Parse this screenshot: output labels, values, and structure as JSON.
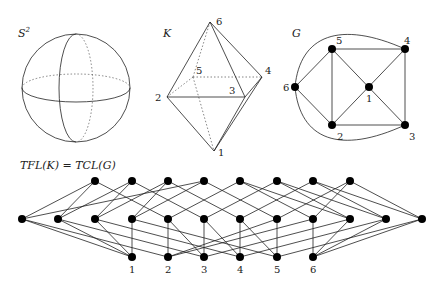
{
  "panels": {
    "sphere": {
      "title": "S",
      "superscript": "2"
    },
    "complex": {
      "title": "K",
      "vertices": [
        {
          "id": "1",
          "x": 214,
          "y": 151,
          "lx": 218,
          "ly": 156
        },
        {
          "id": "2",
          "x": 167,
          "y": 97,
          "lx": 155,
          "ly": 101
        },
        {
          "id": "3",
          "x": 245,
          "y": 97,
          "lx": 229,
          "ly": 94
        },
        {
          "id": "4",
          "x": 262,
          "y": 77,
          "lx": 265,
          "ly": 74
        },
        {
          "id": "5",
          "x": 193,
          "y": 77,
          "lx": 196,
          "ly": 74
        },
        {
          "id": "6",
          "x": 210,
          "y": 22,
          "lx": 216,
          "ly": 25
        }
      ]
    },
    "graph": {
      "title": "G",
      "vertices": [
        {
          "id": "1",
          "x": 369,
          "y": 87,
          "lx": 366,
          "ly": 102
        },
        {
          "id": "2",
          "x": 332,
          "y": 125,
          "lx": 337,
          "ly": 140
        },
        {
          "id": "3",
          "x": 405,
          "y": 125,
          "lx": 409,
          "ly": 140
        },
        {
          "id": "4",
          "x": 405,
          "y": 49,
          "lx": 404,
          "ly": 44
        },
        {
          "id": "5",
          "x": 332,
          "y": 49,
          "lx": 336,
          "ly": 44
        },
        {
          "id": "6",
          "x": 295,
          "y": 87,
          "lx": 283,
          "ly": 91
        }
      ]
    }
  },
  "lattice": {
    "title": "TFL(K) = TCL(G)",
    "top_y": 181,
    "mid_y": 219,
    "bot_y": 257,
    "top_x": [
      95,
      132,
      168,
      204,
      240,
      277,
      313,
      350
    ],
    "mid_x": [
      22,
      58,
      95,
      132,
      168,
      204,
      240,
      277,
      313,
      350,
      386,
      422
    ],
    "bot_x": [
      132,
      168,
      204,
      240,
      277,
      313
    ],
    "bottom_labels": [
      "1",
      "2",
      "3",
      "4",
      "5",
      "6"
    ],
    "top_mid_edges": [
      [
        0,
        0
      ],
      [
        0,
        1
      ],
      [
        0,
        4
      ],
      [
        1,
        1
      ],
      [
        1,
        2
      ],
      [
        1,
        5
      ],
      [
        2,
        2
      ],
      [
        2,
        3
      ],
      [
        2,
        6
      ],
      [
        3,
        3
      ],
      [
        3,
        0
      ],
      [
        3,
        7
      ],
      [
        4,
        8
      ],
      [
        4,
        9
      ],
      [
        4,
        4
      ],
      [
        5,
        9
      ],
      [
        5,
        10
      ],
      [
        5,
        5
      ],
      [
        6,
        10
      ],
      [
        6,
        11
      ],
      [
        6,
        6
      ],
      [
        7,
        11
      ],
      [
        7,
        8
      ],
      [
        7,
        7
      ]
    ],
    "mid_bot_edges": [
      [
        0,
        0
      ],
      [
        1,
        0
      ],
      [
        2,
        0
      ],
      [
        3,
        0
      ],
      [
        0,
        1
      ],
      [
        4,
        1
      ],
      [
        7,
        1
      ],
      [
        8,
        1
      ],
      [
        1,
        2
      ],
      [
        4,
        2
      ],
      [
        5,
        2
      ],
      [
        9,
        2
      ],
      [
        2,
        3
      ],
      [
        5,
        3
      ],
      [
        6,
        3
      ],
      [
        10,
        3
      ],
      [
        3,
        4
      ],
      [
        6,
        4
      ],
      [
        7,
        4
      ],
      [
        11,
        4
      ],
      [
        8,
        5
      ],
      [
        9,
        5
      ],
      [
        10,
        5
      ],
      [
        11,
        5
      ]
    ]
  }
}
